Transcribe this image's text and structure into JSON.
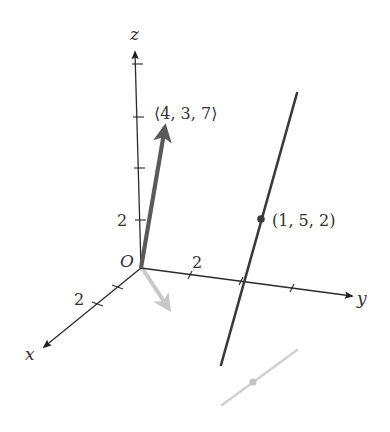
{
  "figure": {
    "axes": {
      "x_label": "x",
      "y_label": "y",
      "z_label": "z",
      "origin_label": "O",
      "x_tick_label": "2",
      "y_tick_label": "2",
      "z_tick_label": "2"
    },
    "vector": {
      "label": "⟨4, 3, 7⟩",
      "components": [
        4,
        3,
        7
      ],
      "color": "#5a5a5a"
    },
    "projected_vector": {
      "color": "#c8c8c8"
    },
    "line": {
      "point_label": "(1, 5, 2)",
      "point": [
        1,
        5,
        2
      ],
      "color": "#3a3a3a"
    },
    "projected_line": {
      "color": "#cccccc"
    },
    "colors": {
      "axis": "#2b2b2b",
      "text": "#333333",
      "background": "#ffffff"
    }
  }
}
